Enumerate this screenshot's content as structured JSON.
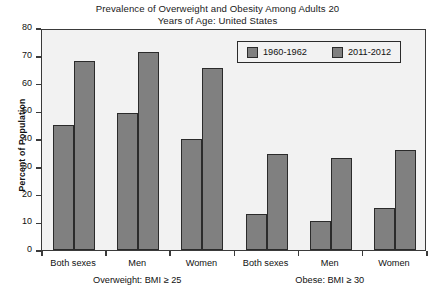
{
  "chart_data": {
    "type": "bar",
    "title": "Prevalence of Overweight and Obesity Among Adults 20 Years of Age: United States",
    "title_line1": "Prevalence of Overweight and Obesity Among Adults 20",
    "title_line2": "Years of Age: United States",
    "xlabel": "",
    "ylabel": "Percent of Population",
    "ylim": [
      0,
      80
    ],
    "yticks": [
      0,
      10,
      20,
      30,
      40,
      50,
      60,
      70,
      80
    ],
    "grid": false,
    "legend_position": "top-right",
    "categories": [
      "Both sexes",
      "Men",
      "Women",
      "Both sexes",
      "Men",
      "Women"
    ],
    "groups": [
      {
        "label": "Overweight: BMI ≥ 25",
        "categories": [
          "Both sexes",
          "Men",
          "Women"
        ]
      },
      {
        "label": "Obese: BMI ≥ 30",
        "categories": [
          "Both sexes",
          "Men",
          "Women"
        ]
      }
    ],
    "series": [
      {
        "name": "1960-1962",
        "color": "#808080",
        "values": [
          45,
          49.5,
          40,
          13,
          10.5,
          15
        ]
      },
      {
        "name": "2011-2012",
        "color": "#808080",
        "values": [
          68,
          71.5,
          65.5,
          34.5,
          33,
          36
        ]
      }
    ]
  },
  "legend": {
    "entries": [
      {
        "label": "1960-1962"
      },
      {
        "label": "2011-2012"
      }
    ]
  },
  "colors": {
    "bar_fill": "#808080",
    "bar_border": "#2b2b2b",
    "plot_background": "#f2f2f2",
    "frame": "#3a3a3a",
    "text": "#111111"
  }
}
